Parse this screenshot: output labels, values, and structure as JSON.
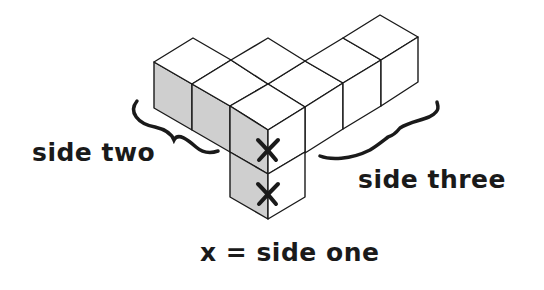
{
  "diagram": {
    "type": "isometric-cube-arrangement",
    "colors": {
      "stroke": "#1a1a1a",
      "shaded_face": "#cfcfcf",
      "top_face": "#ffffff",
      "right_face": "#ffffff",
      "background": "#ffffff"
    },
    "labels": {
      "side_two": "side two",
      "side_three": "side three",
      "side_one_key": "x = side one"
    },
    "marks": {
      "symbol": "x",
      "count": 2
    }
  }
}
